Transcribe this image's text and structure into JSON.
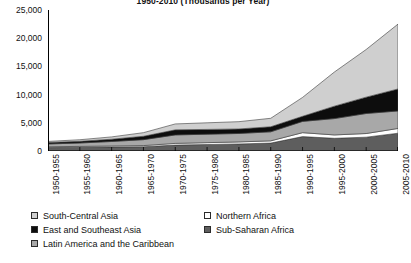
{
  "chart_data": {
    "type": "area",
    "stacked": true,
    "title": "1950-2010 (Thousands per Year)",
    "xlabel": "",
    "ylabel": "",
    "ylim": [
      0,
      25000
    ],
    "yticks": [
      0,
      5000,
      10000,
      15000,
      20000,
      25000
    ],
    "ytick_labels": [
      "0",
      "5,000",
      "10,000",
      "15,000",
      "20,000",
      "25,000"
    ],
    "grid": false,
    "legend_position": "bottom",
    "categories": [
      "1950-1955",
      "1955-1960",
      "1960-1965",
      "1965-1970",
      "1970-1975",
      "1975-1980",
      "1980-1985",
      "1985-1990",
      "1990-1995",
      "1995-2000",
      "2000-2005",
      "2005-2010"
    ],
    "stack_order_bottom_to_top": [
      "Sub-Saharan Africa",
      "Northern Africa",
      "Latin America and the Caribbean",
      "East and Southeast Asia",
      "South-Central Asia"
    ],
    "series": [
      {
        "name": "Sub-Saharan Africa",
        "color": "#5e5e5e",
        "values": [
          600,
          650,
          700,
          750,
          1050,
          1150,
          1250,
          1400,
          2550,
          2250,
          2450,
          3150
        ]
      },
      {
        "name": "Northern Africa",
        "color": "#ffffff",
        "values": [
          150,
          170,
          190,
          210,
          300,
          330,
          360,
          400,
          700,
          600,
          650,
          850
        ]
      },
      {
        "name": "Latin America and the Caribbean",
        "color": "#a8a8a8",
        "values": [
          500,
          600,
          800,
          1050,
          1500,
          1500,
          1500,
          1600,
          2000,
          2900,
          3550,
          3100
        ]
      },
      {
        "name": "East and Southeast Asia",
        "color": "#0d0d0d",
        "values": [
          250,
          300,
          400,
          600,
          900,
          850,
          800,
          900,
          900,
          2200,
          2900,
          3900
        ]
      },
      {
        "name": "South-Central Asia",
        "color": "#cfcfcf",
        "values": [
          200,
          280,
          410,
          640,
          1050,
          1170,
          1290,
          1500,
          3350,
          6050,
          8450,
          11500
        ]
      }
    ],
    "totals": [
      1700,
      2000,
      2500,
      3250,
      4800,
      5000,
      5200,
      5800,
      9500,
      14000,
      18000,
      22500
    ]
  },
  "legend": {
    "items": [
      {
        "label": "South-Central Asia",
        "swatch": "light-gray",
        "column": "left",
        "row": 0
      },
      {
        "label": "East and Southeast Asia",
        "swatch": "black",
        "column": "left",
        "row": 1
      },
      {
        "label": "Latin America and the Caribbean",
        "swatch": "medium-gray",
        "column": "left",
        "row": 2
      },
      {
        "label": "Northern Africa",
        "swatch": "white",
        "column": "right",
        "row": 0
      },
      {
        "label": "Sub-Saharan Africa",
        "swatch": "dark-gray",
        "column": "right",
        "row": 1
      }
    ]
  },
  "axis": {
    "line_color": "#000000",
    "text_color": "#111111"
  }
}
